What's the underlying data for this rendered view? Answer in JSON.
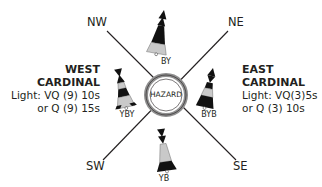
{
  "diagram": {
    "directions": {
      "nw": "NW",
      "ne": "NE",
      "sw": "SW",
      "se": "SE"
    },
    "center": {
      "label": "HAZARD"
    },
    "west": {
      "title_line1": "WEST",
      "title_line2": "CARDINAL",
      "light_line1": "Light: VQ (9) 10s",
      "light_line2": "or Q (9) 15s"
    },
    "east": {
      "title_line1": "EAST",
      "title_line2": "CARDINAL",
      "light_line1": "Light: VQ(3)5s",
      "light_line2": "or Q (3) 10s"
    },
    "marks": {
      "north": {
        "code": "BY"
      },
      "west": {
        "code": "YBY"
      },
      "east": {
        "code": "BYB"
      },
      "south": {
        "code": "YB"
      }
    },
    "colors": {
      "black": "#111111",
      "yellow_as_grey": "#c9c9c9",
      "line": "#231f20",
      "ring": "#9a9a9a"
    }
  }
}
